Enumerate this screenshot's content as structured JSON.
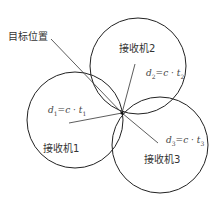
{
  "diagram": {
    "target_label": "目标位置",
    "receivers": [
      {
        "label": "接收机1",
        "formula_d": "d",
        "formula_sub": "1",
        "formula_mid": "=c · t",
        "formula_sub2": "1",
        "center": [
          75,
          120
        ],
        "radius": 48
      },
      {
        "label": "接收机2",
        "formula_d": "d",
        "formula_sub": "2",
        "formula_mid": "=c · t",
        "formula_sub2": "2",
        "center": [
          138,
          66
        ],
        "radius": 48
      },
      {
        "label": "接收机3",
        "formula_d": "d",
        "formula_sub": "3",
        "formula_mid": "=c · t",
        "formula_sub2": "3",
        "center": [
          160,
          145
        ],
        "radius": 48
      }
    ],
    "target_point": [
      122,
      113
    ],
    "colors": {
      "stroke": "#222222",
      "text": "#333333",
      "background": "#ffffff"
    }
  }
}
